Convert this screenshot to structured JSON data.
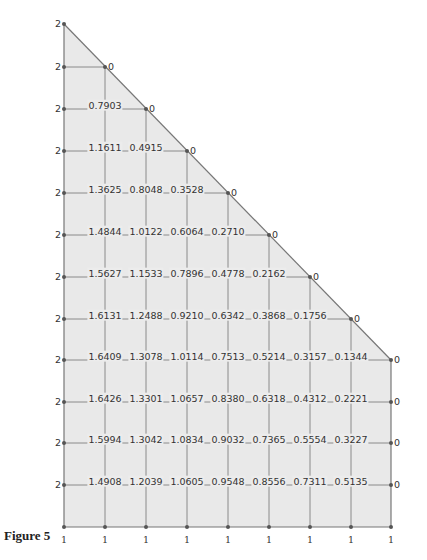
{
  "figure": {
    "caption": "Figure 5",
    "colors": {
      "fill": "#e9e9e9",
      "grid": "#8a8a8a",
      "edge": "#777777",
      "node": "#555555",
      "text": "#333333"
    },
    "left_boundary_value": "2",
    "bottom_boundary_value": "1",
    "diagonal_boundary_value": "0",
    "right_boundary_value": "0"
  },
  "grid": {
    "col_x": [
      64,
      105,
      146,
      187,
      228,
      269,
      310,
      351,
      391
    ],
    "row_y": [
      24,
      67,
      109,
      151,
      193,
      235,
      277,
      319,
      360,
      402,
      443,
      485,
      527
    ],
    "rows": [
      [],
      [],
      [
        "0.7903"
      ],
      [
        "1.1611",
        "0.4915"
      ],
      [
        "1.3625",
        "0.8048",
        "0.3528"
      ],
      [
        "1.4844",
        "1.0122",
        "0.6064",
        "0.2710"
      ],
      [
        "1.5627",
        "1.1533",
        "0.7896",
        "0.4778",
        "0.2162"
      ],
      [
        "1.6131",
        "1.2488",
        "0.9210",
        "0.6342",
        "0.3868",
        "0.1756"
      ],
      [
        "1.6409",
        "1.3078",
        "1.0114",
        "0.7513",
        "0.5214",
        "0.3157",
        "0.1344"
      ],
      [
        "1.6426",
        "1.3301",
        "1.0657",
        "0.8380",
        "0.6318",
        "0.4312",
        "0.2221"
      ],
      [
        "1.5994",
        "1.3042",
        "1.0834",
        "0.9032",
        "0.7365",
        "0.5554",
        "0.3227"
      ],
      [
        "1.4908",
        "1.2039",
        "1.0605",
        "0.9548",
        "0.8556",
        "0.7311",
        "0.5135"
      ],
      []
    ]
  }
}
